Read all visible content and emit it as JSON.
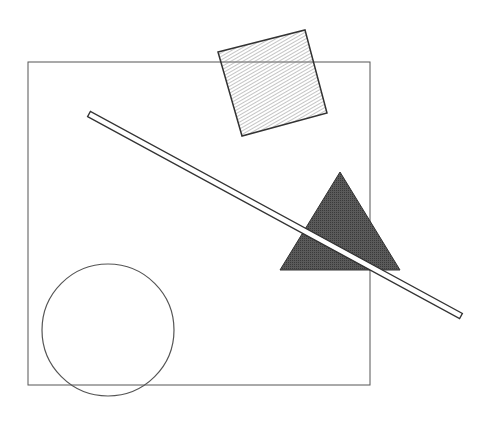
{
  "diagram": {
    "width": 489,
    "height": 421,
    "background": "#ffffff",
    "frame": {
      "x": 28,
      "y": 62,
      "width": 342,
      "height": 323,
      "stroke": "#555555"
    },
    "shapes": [
      {
        "kind": "square",
        "label": "hatched-square",
        "points": [
          [
            218,
            52
          ],
          [
            305,
            30
          ],
          [
            327,
            113
          ],
          [
            242,
            136
          ]
        ],
        "fill": "hatched",
        "stroke": "#333333"
      },
      {
        "kind": "triangle",
        "label": "dark-triangle",
        "points": [
          [
            340,
            172
          ],
          [
            280,
            270
          ],
          [
            400,
            270
          ]
        ],
        "fill": "#4a4a4a",
        "stroke": "#333333"
      },
      {
        "kind": "bar",
        "label": "diagonal-bar",
        "from": [
          89,
          114
        ],
        "to": [
          461,
          316
        ],
        "thickness": 6,
        "fill": "#ffffff",
        "stroke": "#333333"
      },
      {
        "kind": "circle",
        "label": "circle",
        "cx": 108,
        "cy": 330,
        "r": 66,
        "fill": "none",
        "stroke": "#555555"
      }
    ]
  }
}
